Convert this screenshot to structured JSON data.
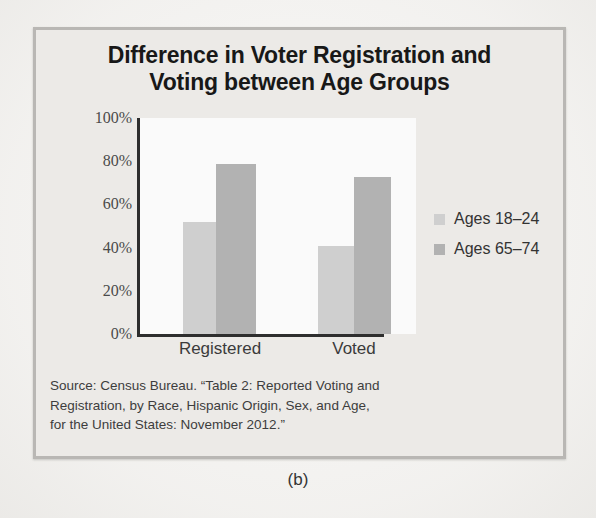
{
  "figure": {
    "caption": "(b)"
  },
  "chart_data": {
    "type": "bar",
    "title": "Difference in Voter Registration and Voting between Age Groups",
    "title_lines": [
      "Difference in Voter Registration and",
      "Voting between Age Groups"
    ],
    "xlabel": "",
    "ylabel": "",
    "categories": [
      "Registered",
      "Voted"
    ],
    "series": [
      {
        "name": "Ages 18–24",
        "values": [
          52,
          41
        ],
        "color": "#cfcfcf"
      },
      {
        "name": "Ages 65–74",
        "values": [
          79,
          73
        ],
        "color": "#b2b2b2"
      }
    ],
    "ylim": [
      0,
      100
    ],
    "yticks": [
      0,
      20,
      40,
      60,
      80,
      100
    ],
    "ytick_labels": [
      "0%",
      "20%",
      "40%",
      "60%",
      "80%",
      "100%"
    ],
    "grid": false,
    "legend_position": "right",
    "value_suffix": "%"
  },
  "source": {
    "lines": [
      "Source: Census Bureau. “Table 2: Reported Voting and",
      "Registration, by Race, Hispanic Origin, Sex, and Age,",
      "for the United States: November 2012.”"
    ]
  }
}
